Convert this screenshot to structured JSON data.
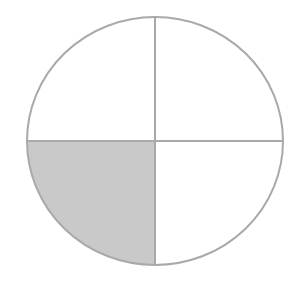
{
  "diagram": {
    "type": "fraction-circle",
    "total_parts": 4,
    "shaded_parts": 1,
    "shaded_quadrant": "bottom-left",
    "fraction": "1/4",
    "colors": {
      "background": "#ffffff",
      "stroke": "#a9a9a9",
      "shaded_fill": "#c9c9c9",
      "unshaded_fill": "#ffffff"
    },
    "geometry": {
      "cx": 155,
      "cy": 141,
      "rx": 128,
      "ry": 124,
      "stroke_width": 2
    }
  }
}
